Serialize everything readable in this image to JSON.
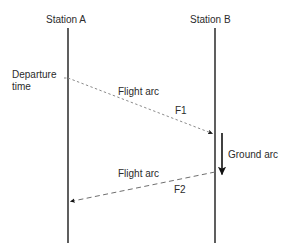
{
  "diagram": {
    "background_color": "#ffffff",
    "line_color": "#555555",
    "arc_color": "#777777",
    "arrow_color": "#111111",
    "text_color": "#2b2b2b",
    "stations": [
      {
        "id": "station-a",
        "label": "Station A",
        "x": 68,
        "label_x": 46,
        "label_y": 14
      },
      {
        "id": "station-b",
        "label": "Station B",
        "x": 215,
        "label_x": 190,
        "label_y": 14
      }
    ],
    "timeline": {
      "y_top": 28,
      "y_bottom": 243
    },
    "annotations": {
      "departure_line1": "Departure",
      "departure_line2": "time",
      "flight_arc_1": "Flight arc",
      "flight_arc_1_code": "F1",
      "ground_arc": "Ground arc",
      "flight_arc_2": "Flight arc",
      "flight_arc_2_code": "F2"
    },
    "arcs": [
      {
        "id": "flight-arc-1",
        "label": "Flight arc",
        "code": "F1",
        "style": "dotted",
        "from": {
          "station": "Station A",
          "x": 68,
          "y": 78
        },
        "to": {
          "station": "Station B",
          "x": 214,
          "y": 134
        }
      },
      {
        "id": "ground-arc",
        "label": "Ground arc",
        "code": "",
        "style": "solid",
        "from": {
          "station": "Station B",
          "x": 222,
          "y": 134
        },
        "to": {
          "station": "Station B",
          "x": 222,
          "y": 176
        }
      },
      {
        "id": "flight-arc-2",
        "label": "Flight arc",
        "code": "F2",
        "style": "dashed",
        "from": {
          "station": "Station B",
          "x": 214,
          "y": 172
        },
        "to": {
          "station": "Station A",
          "x": 69,
          "y": 202
        }
      }
    ]
  }
}
